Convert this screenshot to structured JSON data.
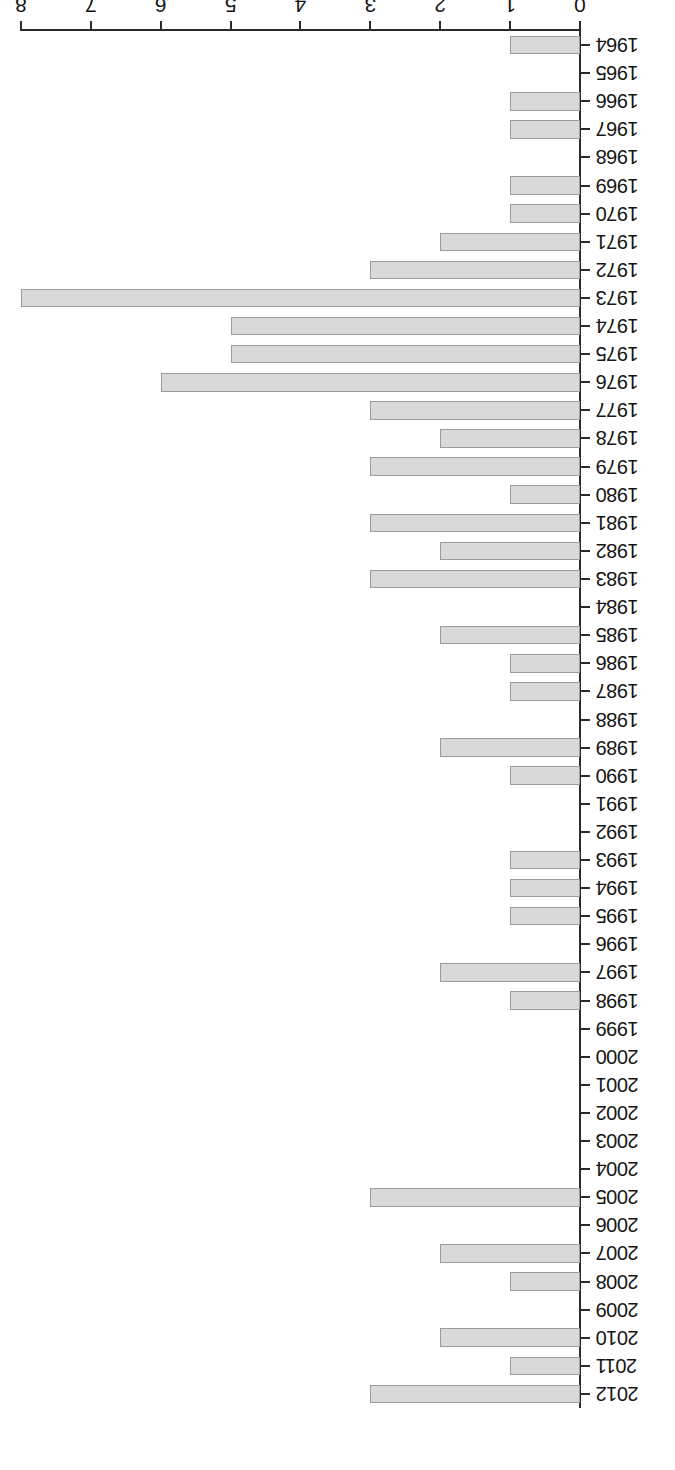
{
  "chart_data": {
    "type": "bar",
    "orientation": "horizontal",
    "title": "",
    "subtitle": "",
    "xlabel": "",
    "ylabel": "",
    "xlim": [
      0,
      8
    ],
    "xticks": [
      0,
      1,
      2,
      3,
      4,
      5,
      6,
      7,
      8
    ],
    "xtick_labels": [
      "0",
      "1",
      "2",
      "3",
      "4",
      "5",
      "6",
      "7",
      "8"
    ],
    "grid": false,
    "legend": null,
    "rotation_deg": 180,
    "bar_fill": "#d9d9d9",
    "bar_stroke": "#9b9b9b",
    "axis_color": "#2b2b2b",
    "categories": [
      "2012",
      "2011",
      "2010",
      "2009",
      "2008",
      "2007",
      "2006",
      "2005",
      "2004",
      "2003",
      "2002",
      "2001",
      "2000",
      "1999",
      "1998",
      "1997",
      "1996",
      "1995",
      "1994",
      "1993",
      "1992",
      "1991",
      "1990",
      "1989",
      "1988",
      "1987",
      "1986",
      "1985",
      "1984",
      "1983",
      "1982",
      "1981",
      "1980",
      "1979",
      "1978",
      "1977",
      "1976",
      "1975",
      "1974",
      "1973",
      "1972",
      "1971",
      "1970",
      "1969",
      "1968",
      "1967",
      "1966",
      "1965",
      "1964"
    ],
    "values": [
      3,
      1,
      2,
      0,
      1,
      2,
      0,
      3,
      0,
      0,
      0,
      0,
      0,
      0,
      1,
      2,
      0,
      1,
      1,
      1,
      0,
      0,
      1,
      2,
      0,
      1,
      1,
      2,
      0,
      3,
      2,
      3,
      1,
      3,
      2,
      3,
      6,
      5,
      5,
      8,
      3,
      2,
      1,
      1,
      0,
      1,
      1,
      0,
      1
    ]
  }
}
